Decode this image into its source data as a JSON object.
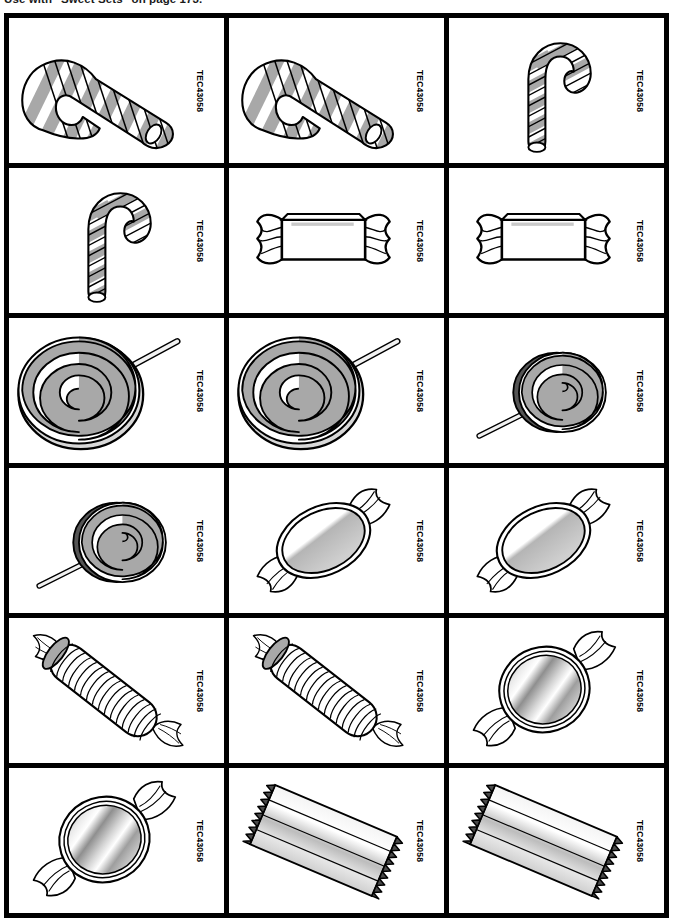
{
  "header": {
    "caption": "Use with \"Sweet Sets\" on page 173."
  },
  "grid": {
    "columns": 3,
    "rows": 6,
    "border_color": "#000000",
    "background_color": "#ffffff",
    "fill_gray": "#a8a8a8",
    "cards": [
      {
        "code": "TEC43058",
        "art": "candy-cane-large-left",
        "name": "candy-cane"
      },
      {
        "code": "TEC43058",
        "art": "candy-cane-large-left",
        "name": "candy-cane"
      },
      {
        "code": "TEC43058",
        "art": "candy-cane-small-upright",
        "name": "candy-cane"
      },
      {
        "code": "TEC43058",
        "art": "candy-cane-small-upright",
        "name": "candy-cane"
      },
      {
        "code": "TEC43058",
        "art": "wrapped-rectangle-candy",
        "name": "wrapped-candy"
      },
      {
        "code": "TEC43058",
        "art": "wrapped-rectangle-candy",
        "name": "wrapped-candy"
      },
      {
        "code": "TEC43058",
        "art": "swirl-lollipop-large",
        "name": "lollipop"
      },
      {
        "code": "TEC43058",
        "art": "swirl-lollipop-large",
        "name": "lollipop"
      },
      {
        "code": "TEC43058",
        "art": "swirl-lollipop-small",
        "name": "lollipop"
      },
      {
        "code": "TEC43058",
        "art": "swirl-lollipop-small",
        "name": "lollipop"
      },
      {
        "code": "TEC43058",
        "art": "oval-wrapped-candy",
        "name": "wrapped-candy"
      },
      {
        "code": "TEC43058",
        "art": "oval-wrapped-candy",
        "name": "wrapped-candy"
      },
      {
        "code": "TEC43058",
        "art": "ribbed-roll-candy",
        "name": "roll-candy"
      },
      {
        "code": "TEC43058",
        "art": "ribbed-roll-candy",
        "name": "roll-candy"
      },
      {
        "code": "TEC43058",
        "art": "round-foil-candy",
        "name": "foil-candy"
      },
      {
        "code": "TEC43058",
        "art": "round-foil-candy",
        "name": "foil-candy"
      },
      {
        "code": "TEC43058",
        "art": "candy-bar-foil",
        "name": "candy-bar"
      },
      {
        "code": "TEC43058",
        "art": "candy-bar-foil",
        "name": "candy-bar"
      }
    ]
  }
}
